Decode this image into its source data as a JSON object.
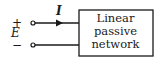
{
  "diagram": {
    "terminals": {
      "plus": "+",
      "minus": "−",
      "voltage": "E"
    },
    "current_label": "I",
    "box": {
      "line1": "Linear",
      "line2": "passive",
      "line3": "network"
    },
    "colors": {
      "stroke": "#1a1a1a",
      "background": "#ffffff"
    }
  }
}
